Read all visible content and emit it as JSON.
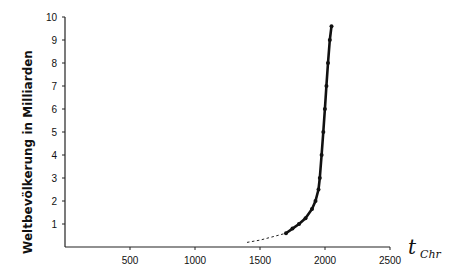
{
  "chart_data": {
    "type": "line",
    "title": "",
    "xlabel": "t",
    "xlabel_subscript": "Chr",
    "ylabel": "Weltbevölkerung in Milliarden",
    "xlim": [
      0,
      2500
    ],
    "ylim": [
      0,
      10
    ],
    "x_ticks": [
      500,
      1000,
      1500,
      2000,
      2500
    ],
    "y_ticks": [
      1,
      2,
      3,
      4,
      5,
      6,
      7,
      8,
      9,
      10
    ],
    "grid": false,
    "legend": null,
    "series": [
      {
        "name": "estimated (dashed)",
        "style": "dashed",
        "x": [
          1400,
          1500,
          1600,
          1700
        ],
        "y": [
          0.2,
          0.3,
          0.45,
          0.6
        ]
      },
      {
        "name": "population",
        "style": "solid-with-markers",
        "x": [
          1700,
          1750,
          1800,
          1850,
          1900,
          1927,
          1950,
          1960,
          1974,
          1987,
          1999,
          2011,
          2023,
          2037,
          2050
        ],
        "y": [
          0.6,
          0.8,
          1.0,
          1.25,
          1.65,
          2.0,
          2.5,
          3.0,
          4.0,
          5.0,
          6.0,
          7.0,
          8.0,
          9.0,
          9.6
        ]
      }
    ]
  }
}
